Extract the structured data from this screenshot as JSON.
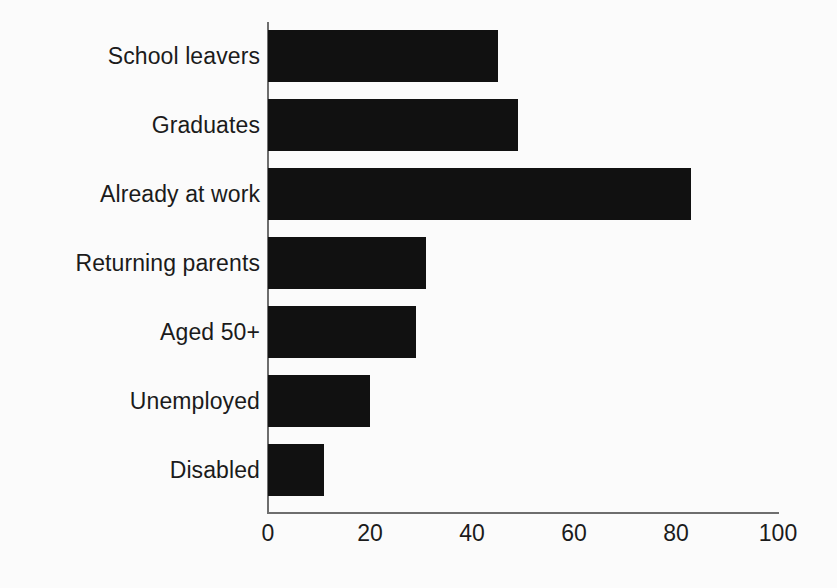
{
  "chart_data": {
    "type": "bar",
    "orientation": "horizontal",
    "title": "",
    "subtitle": "",
    "xlabel": "",
    "ylabel": "",
    "categories": [
      "School leavers",
      "Graduates",
      "Already at work",
      "Returning parents",
      "Aged 50+",
      "Unemployed",
      "Disabled"
    ],
    "values": [
      45,
      49,
      83,
      31,
      29,
      20,
      11
    ],
    "xlim": [
      0,
      100
    ],
    "xticks": [
      0,
      20,
      40,
      60,
      80,
      100
    ],
    "xtick_labels": [
      "0",
      "20",
      "40",
      "60",
      "80",
      "100"
    ],
    "grid": false,
    "legend": null,
    "bar_color": "#111111",
    "axis_color": "#6e6e6e",
    "background_color": "#fbfbfb",
    "text_color": "#1b1b1b"
  }
}
